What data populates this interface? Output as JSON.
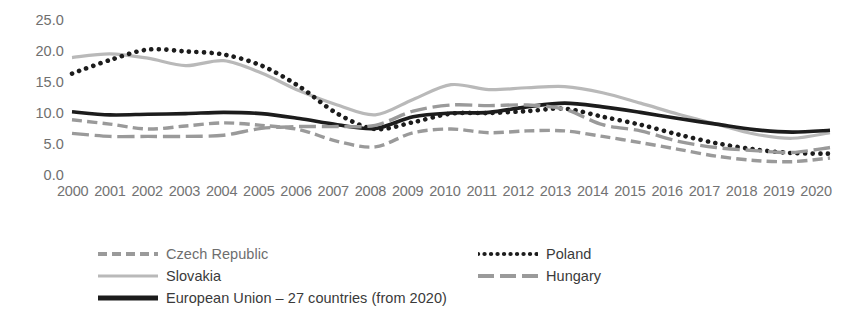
{
  "chart_data": {
    "type": "line",
    "title": "",
    "xlabel": "",
    "ylabel": "",
    "grid": false,
    "legend_position": "bottom",
    "ylim": [
      0.0,
      25.0
    ],
    "y_ticks": [
      "0.0",
      "5.0",
      "10.0",
      "15.0",
      "20.0",
      "25.0"
    ],
    "y_tick_values": [
      0.0,
      5.0,
      10.0,
      15.0,
      20.0,
      25.0
    ],
    "categories": [
      "2000",
      "2001",
      "2002",
      "2003",
      "2004",
      "2005",
      "2006",
      "2007",
      "2008",
      "2009",
      "2010",
      "2011",
      "2012",
      "2013",
      "2014",
      "2015",
      "2016",
      "2017",
      "2018",
      "2019",
      "2020"
    ],
    "series": [
      {
        "name": "Czech Republic",
        "color": "#9a9a9a",
        "style": "dashed",
        "width": 3.4,
        "values": [
          8.8,
          8.1,
          7.3,
          7.8,
          8.3,
          7.9,
          7.2,
          5.3,
          4.4,
          6.7,
          7.3,
          6.7,
          7.0,
          7.0,
          6.1,
          5.1,
          4.0,
          2.9,
          2.2,
          2.0,
          2.6
        ]
      },
      {
        "name": "Slovakia",
        "color": "#b9b9b9",
        "style": "solid",
        "width": 3.2,
        "values": [
          18.9,
          19.5,
          18.8,
          17.6,
          18.4,
          16.4,
          13.5,
          11.2,
          9.6,
          12.1,
          14.5,
          13.7,
          14.0,
          14.2,
          13.2,
          11.5,
          9.7,
          8.1,
          6.5,
          5.8,
          6.7
        ]
      },
      {
        "name": "European Union – 27 countries (from 2020)",
        "color": "#1c1c1c",
        "style": "solid",
        "width": 3.6,
        "values": [
          10.1,
          9.6,
          9.7,
          9.8,
          10.0,
          9.8,
          9.0,
          8.0,
          7.4,
          9.3,
          9.9,
          10.0,
          10.9,
          11.5,
          10.9,
          10.0,
          9.0,
          8.1,
          7.2,
          6.8,
          7.1
        ]
      },
      {
        "name": "Poland",
        "color": "#1c1c1c",
        "style": "dotted",
        "width": 4.6,
        "values": [
          16.3,
          18.5,
          20.2,
          19.9,
          19.4,
          17.6,
          14.2,
          9.8,
          7.3,
          8.4,
          9.8,
          9.9,
          10.2,
          10.6,
          9.3,
          8.0,
          6.4,
          5.0,
          4.0,
          3.4,
          3.3
        ]
      },
      {
        "name": "Hungary",
        "color": "#9a9a9a",
        "style": "longdash",
        "width": 3.4,
        "values": [
          6.6,
          6.1,
          6.1,
          6.1,
          6.3,
          7.4,
          7.7,
          7.7,
          7.9,
          10.2,
          11.2,
          11.1,
          11.2,
          10.5,
          8.0,
          7.0,
          5.3,
          4.3,
          3.8,
          3.5,
          4.3
        ]
      }
    ]
  },
  "axis": {
    "y_labels": [
      "25.0",
      "20.0",
      "15.0",
      "10.0",
      "5.0",
      "0.0"
    ],
    "x_labels": [
      "2000",
      "2001",
      "2002",
      "2003",
      "2004",
      "2005",
      "2006",
      "2007",
      "2008",
      "2009",
      "2010",
      "2011",
      "2012",
      "2013",
      "2014",
      "2015",
      "2016",
      "2017",
      "2018",
      "2019",
      "2020"
    ]
  },
  "legend": {
    "items": [
      {
        "label": "Czech Republic",
        "style": "dashed",
        "color": "#9a9a9a"
      },
      {
        "label": "Slovakia",
        "style": "solid",
        "color": "#b9b9b9"
      },
      {
        "label": "European Union – 27 countries (from 2020)",
        "style": "solid",
        "color": "#1c1c1c"
      },
      {
        "label": "Poland",
        "style": "dotted",
        "color": "#1c1c1c"
      },
      {
        "label": "Hungary",
        "style": "longdash",
        "color": "#9a9a9a"
      }
    ]
  }
}
